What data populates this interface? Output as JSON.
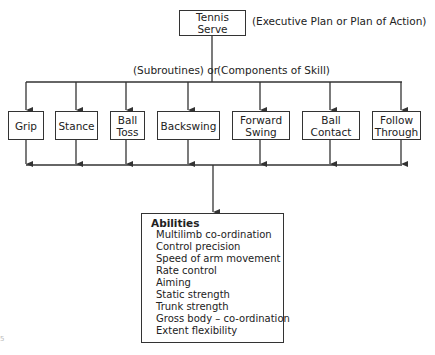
{
  "top": {
    "label": "Tennis Serve",
    "annotation": "(Executive Plan or Plan of Action)"
  },
  "middle": {
    "left_label": "(Subroutines)  or",
    "right_label": "(Components of Skill)"
  },
  "components": [
    {
      "line1": "Grip",
      "line2": ""
    },
    {
      "line1": "Stance",
      "line2": ""
    },
    {
      "line1": "Ball",
      "line2": "Toss"
    },
    {
      "line1": "Backswing",
      "line2": ""
    },
    {
      "line1": "Forward",
      "line2": "Swing"
    },
    {
      "line1": "Ball",
      "line2": "Contact"
    },
    {
      "line1": "Follow",
      "line2": "Through"
    }
  ],
  "abilities": {
    "title": "Abilities",
    "items": [
      "Multilimb co-ordination",
      "Control precision",
      "Speed of arm movement",
      "Rate control",
      "Aiming",
      "Static strength",
      "Trunk strength",
      "Gross body – co-ordination",
      "Extent flexibility"
    ]
  },
  "corner_mark": "5",
  "colors": {
    "line": "#333333",
    "text": "#222222",
    "background": "#ffffff"
  }
}
